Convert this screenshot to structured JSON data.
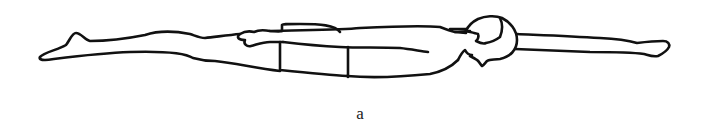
{
  "figure": {
    "caption": "a",
    "stroke_color": "#111111",
    "background": "#ffffff"
  }
}
